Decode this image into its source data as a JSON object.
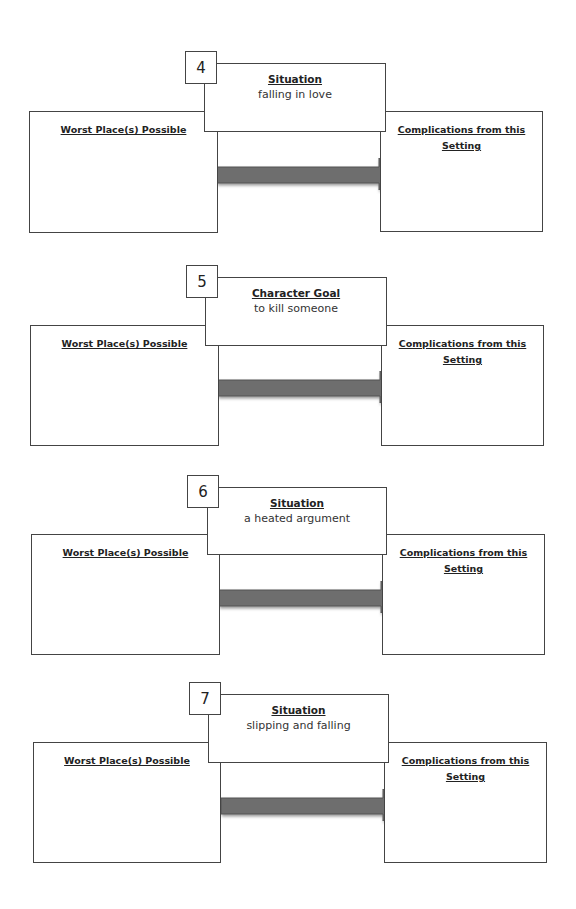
{
  "worksheet": {
    "blocks": [
      {
        "number": "4",
        "prompt_type": "Situation",
        "prompt_value": "falling in love",
        "left_label": "Worst Place(s) Possible",
        "right_label": "Complications from this Setting",
        "geom": {
          "top": 51,
          "dx": 0
        }
      },
      {
        "number": "5",
        "prompt_type": "Character Goal",
        "prompt_value": "to kill someone",
        "left_label": "Worst Place(s) Possible",
        "right_label": "Complications from this Setting",
        "geom": {
          "top": 265,
          "dx": 1
        }
      },
      {
        "number": "6",
        "prompt_type": "Situation",
        "prompt_value": "a heated argument",
        "left_label": "Worst Place(s) Possible",
        "right_label": "Complications from this Setting",
        "geom": {
          "top": 475,
          "dx": 2
        }
      },
      {
        "number": "7",
        "prompt_type": "Situation",
        "prompt_value": "slipping and falling",
        "left_label": "Worst Place(s) Possible",
        "right_label": "Complications from this Setting",
        "geom": {
          "top": 682,
          "dx": 4
        }
      }
    ],
    "colors": {
      "border": "#444444",
      "arrow_fill": "#6e6e6e",
      "arrow_edge": "#555555"
    }
  }
}
